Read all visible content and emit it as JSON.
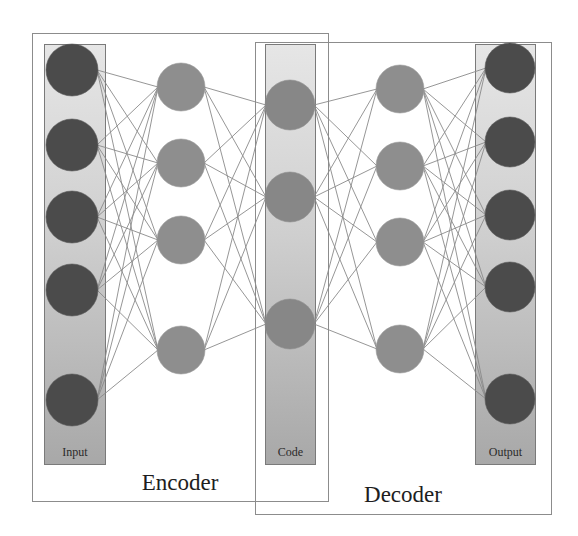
{
  "diagram": {
    "groups": [
      {
        "id": "encoder",
        "label": "Encoder"
      },
      {
        "id": "decoder",
        "label": "Decoder"
      }
    ],
    "layers": [
      {
        "id": "input",
        "label": "Input",
        "nodes": 5,
        "highlighted_column": true
      },
      {
        "id": "encoder_hidden",
        "label": "",
        "nodes": 4,
        "highlighted_column": false
      },
      {
        "id": "code",
        "label": "Code",
        "nodes": 3,
        "highlighted_column": true
      },
      {
        "id": "decoder_hidden",
        "label": "",
        "nodes": 4,
        "highlighted_column": false
      },
      {
        "id": "output",
        "label": "Output",
        "nodes": 5,
        "highlighted_column": true
      }
    ],
    "connectivity": "fully-connected between adjacent layers",
    "colors": {
      "io_node": "#4b4b4b",
      "hidden_node": "#8e8e8e",
      "code_node": "#878787",
      "column_top": "#e4e4e4",
      "column_bottom": "#a9a9a9",
      "edge": "#8a8a8a",
      "box_border": "#8c8c8c"
    }
  },
  "labels": {
    "input": "Input",
    "code": "Code",
    "output": "Output",
    "encoder": "Encoder",
    "decoder": "Decoder"
  }
}
